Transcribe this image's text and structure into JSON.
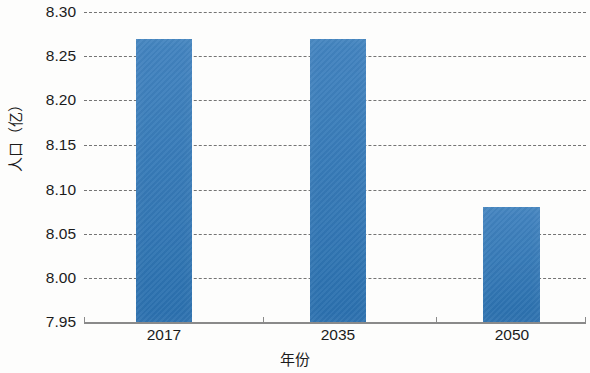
{
  "chart_data": {
    "type": "bar",
    "title": "",
    "subtitle": "",
    "xlabel": "年份",
    "ylabel": "人口（亿）",
    "categories": [
      "2017",
      "2035",
      "2050"
    ],
    "values": [
      8.27,
      8.27,
      8.08
    ],
    "series": [
      {
        "name": "人口",
        "values": [
          8.27,
          8.27,
          8.08
        ],
        "color": "#2d76b8"
      }
    ],
    "ylim": [
      7.95,
      8.3
    ],
    "ytick_labels": [
      "8.30",
      "8.25",
      "8.20",
      "8.15",
      "8.10",
      "8.05",
      "8.00",
      "7.95"
    ],
    "ytick_values": [
      8.3,
      8.25,
      8.2,
      8.15,
      8.1,
      8.05,
      8.0,
      7.95
    ],
    "grid": "horizontal-dashed",
    "legend": "none",
    "annotations": [],
    "bar_color": "#2d76b8",
    "axis_color": "#8a8a8a",
    "grid_color": "#5d5d5d",
    "text_color": "#1b1b1b"
  }
}
